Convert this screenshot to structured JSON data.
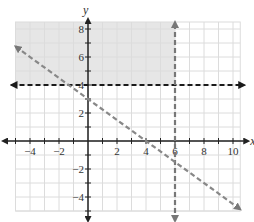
{
  "chart_data": {
    "type": "line",
    "title": "",
    "xlabel": "x",
    "ylabel": "y",
    "xlim": [
      -5,
      10.5
    ],
    "ylim": [
      -5,
      8.5
    ],
    "grid": true,
    "x_ticks": [
      -4,
      -2,
      2,
      4,
      6,
      8,
      10
    ],
    "y_ticks": [
      -4,
      -2,
      2,
      4,
      6,
      8
    ],
    "x_tick_labels": [
      "−4",
      "−2",
      "2",
      "4",
      "6",
      "8",
      "10"
    ],
    "y_tick_labels": [
      "−4",
      "−2",
      "2",
      "4",
      "6",
      "8"
    ],
    "series": [
      {
        "name": "y = 4",
        "style": "dashed",
        "color": "#1a1a1a",
        "equation": "y = 4",
        "x": [
          -5,
          10.5
        ],
        "y": [
          4,
          4
        ]
      },
      {
        "name": "x = 6",
        "style": "dashed",
        "color": "#777777",
        "equation": "x = 6",
        "x": [
          6,
          6
        ],
        "y": [
          -5,
          8.5
        ]
      },
      {
        "name": "y = -3/4 x + 3",
        "style": "dashed",
        "color": "#888888",
        "equation": "y = -0.75x + 3",
        "x": [
          -5,
          10.5
        ],
        "y": [
          6.75,
          -4.875
        ]
      }
    ],
    "shaded_region": {
      "description": "y >= 4 and x <= 6",
      "x": [
        -5,
        6
      ],
      "y": [
        4,
        8.5
      ],
      "color": "#e6e6e6"
    }
  },
  "labels": {
    "x_axis": "x",
    "y_axis": "y"
  }
}
